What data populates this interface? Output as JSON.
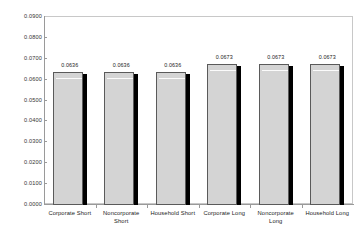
{
  "chart_data": {
    "type": "bar",
    "title": "",
    "xlabel": "",
    "ylabel": "",
    "ylim": [
      0.0,
      0.09
    ],
    "grid": false,
    "legend": "none",
    "categories": [
      "Corporate Short",
      "Noncorporate Short",
      "Household Short",
      "Corporate Long",
      "Noncorporate Long",
      "Household Long"
    ],
    "values": [
      0.0636,
      0.0636,
      0.0636,
      0.0673,
      0.0673,
      0.0673
    ],
    "value_labels": [
      "0.0636",
      "0.0636",
      "0.0636",
      "0.0673",
      "0.0673",
      "0.0673"
    ],
    "ytick_values": [
      0.09,
      0.08,
      0.07,
      0.06,
      0.05,
      0.04,
      0.03,
      0.02,
      0.01,
      0.0
    ],
    "ytick_labels": [
      "0.0900",
      "0.0800",
      "0.0700",
      "0.0600",
      "0.0500",
      "0.0400",
      "0.0300",
      "0.0200",
      "0.0100",
      "0.0000"
    ]
  },
  "style": {
    "bar_fill": "#d4d4d4",
    "bar_outline": "#5a5a5a",
    "bar_shadow": "#000000",
    "frame_color": "#c8c8c8",
    "axis_color": "#9a9a9a",
    "text_color": "#222222",
    "background": "#ffffff"
  }
}
